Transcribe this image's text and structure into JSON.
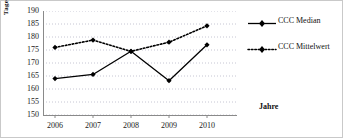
{
  "chart_data": {
    "type": "line",
    "title": "",
    "xlabel": "Jahre",
    "ylabel": "Tage",
    "categories": [
      "2006",
      "2007",
      "2008",
      "2009",
      "2010"
    ],
    "ylim": [
      150,
      190
    ],
    "yticks": [
      190,
      185,
      180,
      175,
      170,
      165,
      160,
      155,
      150
    ],
    "ytick_labels": [
      "190",
      "185",
      "180",
      "175",
      "170",
      "165",
      "160",
      "155",
      "150"
    ],
    "grid": true,
    "grid_style": "dotted-horizontal",
    "grid_color": "#b8b8c8",
    "legend_position": "right",
    "series": [
      {
        "name": "CCC Median",
        "values": [
          164.0,
          165.6,
          174.5,
          163.2,
          177.0
        ],
        "line_style": "solid",
        "marker": "diamond",
        "color": "#000000"
      },
      {
        "name": "CCC Mittelwert",
        "values": [
          176.0,
          178.8,
          174.5,
          178.0,
          184.3
        ],
        "line_style": "dotted",
        "marker": "diamond",
        "color": "#000000"
      }
    ]
  },
  "legend": {
    "items": [
      {
        "label": "CCC Median",
        "symbol": "solid-line-diamond-marker"
      },
      {
        "label": "CCC Mittelwert",
        "symbol": "dotted-line-diamond-marker"
      }
    ]
  }
}
